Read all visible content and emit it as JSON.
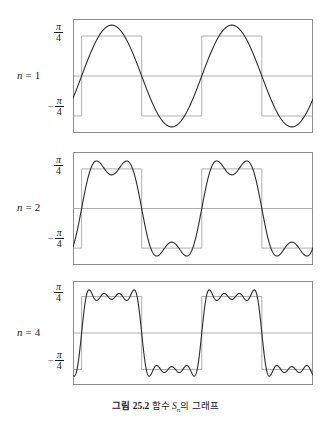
{
  "figure": {
    "caption_prefix": "그림 25.2",
    "caption_text": "함수",
    "caption_symbol": "S",
    "caption_subscript": "n",
    "caption_suffix": "의 그래프",
    "background": "#ffffff",
    "curve_color": "#2b2b2b",
    "reference_color": "#9a9a9a",
    "frame_color": "#8c8c8c",
    "text_color": "#1a1a1a"
  },
  "axis": {
    "positive_tick": {
      "minus": "",
      "numerator": "π",
      "denominator": "4"
    },
    "negative_tick": {
      "minus": "−",
      "numerator": "π",
      "denominator": "4"
    }
  },
  "panels": [
    {
      "label_var": "n",
      "label_eq": "=",
      "label_value": "1",
      "n_terms": 1
    },
    {
      "label_var": "n",
      "label_eq": "=",
      "label_value": "2",
      "n_terms": 2
    },
    {
      "label_var": "n",
      "label_eq": "=",
      "label_value": "4",
      "n_terms": 4
    }
  ],
  "chart_data": {
    "type": "line",
    "xlabel": "",
    "ylabel": "",
    "xlim": [
      -0.45,
      12.1
    ],
    "ylim": [
      -1.12,
      1.12
    ],
    "grid": false,
    "legend": "none",
    "ytick_values": [
      0.7853981634,
      -0.7853981634
    ],
    "ytick_labels": [
      "π/4",
      "−π/4"
    ],
    "reference_series": {
      "name": "square wave",
      "amplitude": 0.7853981634,
      "period": 6.283185307,
      "color": "#9a9a9a"
    },
    "series": [
      {
        "name": "n = 1",
        "terms": 1,
        "formula": "sin(x)",
        "peak_amplitude": 1.0,
        "color": "#2b2b2b"
      },
      {
        "name": "n = 2",
        "terms": 2,
        "formula": "sin(x) + sin(3x)/3",
        "peak_amplitude": 1.0,
        "color": "#2b2b2b"
      },
      {
        "name": "n = 4",
        "terms": 4,
        "formula": "sin(x) + sin(3x)/3 + sin(5x)/5 + sin(7x)/7",
        "peak_amplitude": 1.0,
        "color": "#2b2b2b"
      }
    ]
  }
}
